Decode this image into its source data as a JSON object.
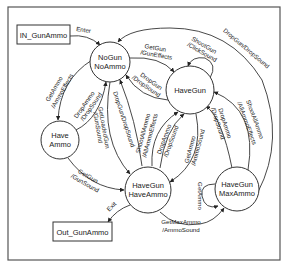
{
  "diagram": {
    "type": "state-machine",
    "terminals": {
      "in": {
        "label": "IN_GunAmmo"
      },
      "out": {
        "label": "Out_GunAmmo"
      }
    },
    "states": [
      {
        "id": "nogun_noammo",
        "line1": "NoGun",
        "line2": "NoAmmo"
      },
      {
        "id": "havegun",
        "line1": "HaveGun",
        "line2": ""
      },
      {
        "id": "haveammo",
        "line1": "Have",
        "line2": "Ammo"
      },
      {
        "id": "havegun_haveammo",
        "line1": "HaveGun",
        "line2": "HaveAmmo"
      },
      {
        "id": "havegun_maxammo",
        "line1": "HaveGun",
        "line2": "MaxAmmo"
      }
    ],
    "transitions": [
      {
        "id": "enter",
        "from": "IN_GunAmmo",
        "to": "NoGun NoAmmo",
        "line1": "Enter",
        "line2": ""
      },
      {
        "id": "getgun_1",
        "from": "NoGun NoAmmo",
        "to": "HaveGun",
        "line1": "GetGun",
        "line2": "/GunEffects"
      },
      {
        "id": "shootgun",
        "from": "HaveGun",
        "to": "HaveGun",
        "line1": "ShootGun",
        "line2": "/ClickSound"
      },
      {
        "id": "dropgun_1",
        "from": "HaveGun",
        "to": "NoGun NoAmmo",
        "line1": "DropGun",
        "line2": "/DropSound"
      },
      {
        "id": "dropgun_max",
        "from": "HaveGun MaxAmmo",
        "to": "NoGun NoAmmo",
        "line1": "DropGun/DropSound",
        "line2": ""
      },
      {
        "id": "getammo_1",
        "from": "NoGun NoAmmo",
        "to": "Have Ammo",
        "line1": "GetAmmo",
        "line2": "/AmmoEffects"
      },
      {
        "id": "dropammo_1",
        "from": "Have Ammo",
        "to": "NoGun NoAmmo",
        "line1": "DropAmmo",
        "line2": "/DropSound"
      },
      {
        "id": "getloadedgun",
        "from": "NoGun NoAmmo",
        "to": "HaveGun HaveAmmo",
        "line1": "GetLoadedGun",
        "line2": "/GunSound"
      },
      {
        "id": "dropgun_2",
        "from": "HaveGun HaveAmmo",
        "to": "NoGun NoAmmo",
        "line1": "DropGun/DropSound",
        "line2": ""
      },
      {
        "id": "shootallammo_1",
        "from": "HaveGun HaveAmmo",
        "to": "HaveGun",
        "line1": "ShootAllAmmo",
        "line2": "/AllAmmoEffects"
      },
      {
        "id": "dropammo_2",
        "from": "HaveGun HaveAmmo",
        "to": "HaveGun",
        "line1": "DropAmmo",
        "line2": "/DropSound"
      },
      {
        "id": "getammo_2",
        "from": "HaveGun",
        "to": "HaveGun HaveAmmo",
        "line1": "GetAmmo",
        "line2": "/AmmoSound"
      },
      {
        "id": "dropammo_3",
        "from": "HaveGun MaxAmmo",
        "to": "HaveGun",
        "line1": "DropAmmo",
        "line2": "/DropSound"
      },
      {
        "id": "shootallammo_2",
        "from": "HaveGun MaxAmmo",
        "to": "HaveGun",
        "line1": "ShootAllAmmo",
        "line2": "/AllAmmoEffects"
      },
      {
        "id": "getgun_2",
        "from": "Have Ammo",
        "to": "HaveGun HaveAmmo",
        "line1": "GetGun",
        "line2": "/GunSound"
      },
      {
        "id": "exit",
        "from": "HaveGun HaveAmmo",
        "to": "Out_GunAmmo",
        "line1": "Exit",
        "line2": ""
      },
      {
        "id": "getmaxammo",
        "from": "HaveGun HaveAmmo",
        "to": "HaveGun MaxAmmo",
        "line1": "GetMaxAmmo",
        "line2": "/AmmoSound"
      },
      {
        "id": "getammo_3",
        "from": "HaveGun MaxAmmo",
        "to": "HaveGun MaxAmmo",
        "line1": "GetAmmo",
        "line2": ""
      }
    ]
  }
}
